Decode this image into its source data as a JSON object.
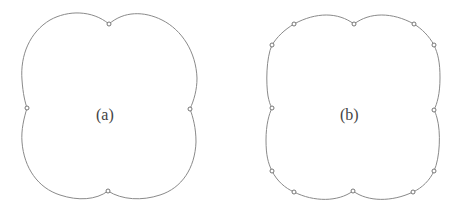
{
  "figure": {
    "panels": [
      {
        "id": "a",
        "label": "(a)",
        "description": "Four-lobed closed curve with 4 control points at the cusps",
        "control_points": [
          [
            109,
            24
          ],
          [
            27,
            108
          ],
          [
            190,
            109
          ],
          [
            108,
            191
          ]
        ]
      },
      {
        "id": "b",
        "label": "(b)",
        "description": "Four-lobed closed curve with 12 control points",
        "control_points": [
          [
            354,
            24
          ],
          [
            294,
            24
          ],
          [
            272,
            45
          ],
          [
            272,
            108
          ],
          [
            272,
            171
          ],
          [
            294,
            192
          ],
          [
            353,
            191
          ],
          [
            413,
            192
          ],
          [
            434,
            171
          ],
          [
            434,
            110
          ],
          [
            434,
            45
          ],
          [
            414,
            24
          ]
        ]
      }
    ],
    "colors": {
      "curve": "#8a8a8a",
      "point_stroke": "#666666",
      "background": "#ffffff"
    }
  }
}
